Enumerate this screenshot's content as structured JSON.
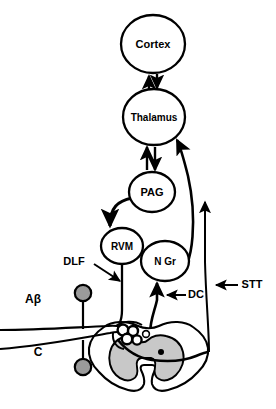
{
  "figure": {
    "background_color": "#ffffff",
    "stroke_color": "#000000",
    "gray_matter_color": "#c8c8c8",
    "ganglion_fill": "#9a9a9a"
  },
  "nodes": [
    {
      "id": "cortex",
      "label": "Cortex",
      "shape": "ellipse",
      "cx": 153,
      "cy": 44,
      "rx": 32,
      "ry": 29,
      "font_size": 11
    },
    {
      "id": "thalamus",
      "label": "Thalamus",
      "shape": "ellipse",
      "cx": 154,
      "cy": 117,
      "rx": 31,
      "ry": 28,
      "font_size": 10
    },
    {
      "id": "pag",
      "label": "PAG",
      "shape": "ellipse",
      "cx": 152,
      "cy": 192,
      "rx": 23,
      "ry": 20,
      "font_size": 11
    },
    {
      "id": "rvm",
      "label": "RVM",
      "shape": "ellipse",
      "cx": 122,
      "cy": 246,
      "rx": 21,
      "ry": 18,
      "font_size": 10
    },
    {
      "id": "ngr",
      "label": "N Gr",
      "shape": "ellipse",
      "cx": 165,
      "cy": 261,
      "rx": 24,
      "ry": 20,
      "font_size": 10
    }
  ],
  "tract_labels": [
    {
      "id": "dlf",
      "label": "DLF",
      "x": 74,
      "y": 262,
      "font_size": 11,
      "arrow": "points-right-down-to-dlf-tract"
    },
    {
      "id": "dc",
      "label": "DC",
      "x": 196,
      "y": 295,
      "font_size": 11,
      "arrow": "points-left-to-dorsal-column"
    },
    {
      "id": "stt",
      "label": "STT",
      "x": 252,
      "y": 285,
      "font_size": 11,
      "arrow": "points-left-to-spinothalamic-tract"
    }
  ],
  "fiber_labels": [
    {
      "id": "abeta",
      "label": "Aβ",
      "x": 33,
      "y": 300,
      "font_size": 12
    },
    {
      "id": "cfiber",
      "label": "C",
      "x": 38,
      "y": 353,
      "font_size": 12
    }
  ],
  "connections": [
    {
      "from": "thalamus",
      "to": "cortex",
      "type": "arrow-up",
      "description": "thalamocortical projection"
    },
    {
      "from": "cortex",
      "to": "thalamus",
      "type": "arrow-down",
      "description": "corticothalamic projection"
    },
    {
      "from": "thalamus",
      "to": "pag",
      "type": "arrow-down",
      "description": "descending to periaqueductal gray"
    },
    {
      "from": "pag",
      "to": "thalamus",
      "type": "arrow-up",
      "description": "ascending to thalamus"
    },
    {
      "from": "pag",
      "to": "rvm",
      "type": "curved-arrow-down",
      "description": "PAG to rostral ventromedial medulla"
    },
    {
      "from": "rvm",
      "to": "spinal-cord",
      "type": "line-down",
      "description": "dorsolateral funiculus descending"
    },
    {
      "from": "ngr",
      "to": "thalamus",
      "type": "curved-arrow-up",
      "description": "nucleus gracilis to thalamus"
    },
    {
      "from": "spinal-cord",
      "to": "ngr",
      "type": "arrow-up",
      "description": "dorsal column to nucleus gracilis"
    },
    {
      "from": "spinal-cord",
      "to": "supraspinal",
      "type": "long-arrow-up",
      "description": "spinothalamic tract ascending"
    }
  ],
  "spinal_cord": {
    "description": "transverse spinal cord cross-section with butterfly gray matter",
    "dorsal_horn_neurons": 4,
    "gray_matter_visible": true
  }
}
